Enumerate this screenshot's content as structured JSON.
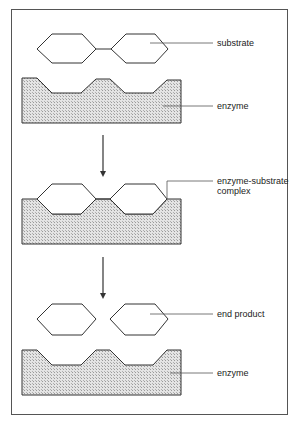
{
  "diagram": {
    "colors": {
      "outline": "#333333",
      "fill": "#d9d9d9",
      "frame": "#555555"
    },
    "stages": [
      {
        "name": "before",
        "labels": [
          "substrate",
          "enzyme"
        ]
      },
      {
        "name": "complex",
        "labels": [
          "enzyme-substrate complex"
        ]
      },
      {
        "name": "after",
        "labels": [
          "end product",
          "enzyme"
        ]
      }
    ],
    "labels": {
      "substrate": "substrate",
      "enzyme_top": "enzyme",
      "complex_line1": "enzyme-substrate",
      "complex_line2": "complex",
      "end_product": "end product",
      "enzyme_bottom": "enzyme"
    }
  }
}
